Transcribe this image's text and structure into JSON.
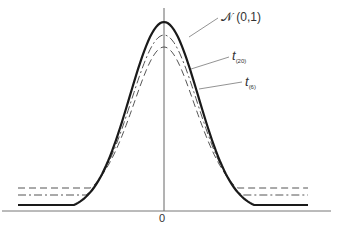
{
  "chart_data": {
    "type": "line",
    "title": "",
    "xlabel": "",
    "ylabel": "",
    "x_ticks": [
      "0"
    ],
    "grid": false,
    "legend_position": "inline-annotations",
    "series": [
      {
        "name": "N(0,1)",
        "label_main": "ℵˀ (0,1)",
        "style": "solid",
        "color": "#222222",
        "width": 2.2,
        "distribution": "normal",
        "df": null,
        "peak": 0.399
      },
      {
        "name": "t(20)",
        "label_main": "t",
        "label_sub": "(20)",
        "style": "dashdot",
        "color": "#555555",
        "width": 1,
        "distribution": "student-t",
        "df": 20,
        "peak": 0.394
      },
      {
        "name": "t(6)",
        "label_main": "t",
        "label_sub": "(6)",
        "style": "dashed",
        "color": "#555555",
        "width": 1,
        "distribution": "student-t",
        "df": 6,
        "peak": 0.383
      }
    ],
    "x_range": [
      -4.2,
      4.2
    ],
    "annotations": [
      {
        "text": "N(0,1)",
        "points_to": "peak-right shoulder of solid curve"
      },
      {
        "text": "t(20)",
        "points_to": "dash-dot curve"
      },
      {
        "text": "t(6)",
        "points_to": "dashed curve"
      }
    ]
  },
  "labels": {
    "normal": "𝒩 (0,1)",
    "t20_main": "t",
    "t20_sub": "(20)",
    "t6_main": "t",
    "t6_sub": "(6)",
    "zero": "0"
  }
}
